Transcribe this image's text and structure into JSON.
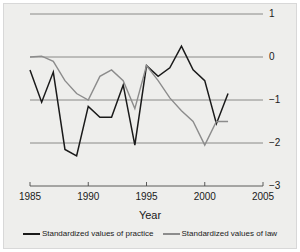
{
  "chart_data": {
    "type": "line",
    "title": "",
    "subtitle": "",
    "xlabel": "Year",
    "ylabel": "",
    "xlim": [
      1985,
      2005
    ],
    "ylim": [
      -3,
      1
    ],
    "grid": true,
    "grid_axis": "y",
    "legend_position": "bottom",
    "x_ticks": [
      1985,
      1990,
      1995,
      2000,
      2005
    ],
    "x_tick_labels": [
      "1985",
      "1990",
      "1995",
      "2000",
      "2005"
    ],
    "y_ticks": [
      1,
      0,
      -1,
      -2,
      -3
    ],
    "y_tick_labels": [
      "1",
      "0",
      "−1",
      "−2",
      "−3"
    ],
    "y_axis_side": "right",
    "series": [
      {
        "name": "Standardized values of practice",
        "color": "#1a1a1a",
        "x": [
          1985,
          1986,
          1987,
          1988,
          1989,
          1990,
          1991,
          1992,
          1993,
          1994,
          1995,
          1996,
          1997,
          1998,
          1999,
          2000,
          2001,
          2002
        ],
        "values": [
          -0.3,
          -1.05,
          -0.35,
          -2.15,
          -2.3,
          -1.15,
          -1.4,
          -1.4,
          -0.65,
          -2.05,
          -0.2,
          -0.45,
          -0.25,
          0.25,
          -0.3,
          -0.55,
          -1.55,
          -0.85
        ]
      },
      {
        "name": "Standardized values of law",
        "color": "#8c8c8c",
        "x": [
          1985,
          1986,
          1987,
          1988,
          1989,
          1990,
          1991,
          1992,
          1993,
          1994,
          1995,
          1996,
          1997,
          1998,
          1999,
          2000,
          2001,
          2002
        ],
        "values": [
          0.0,
          0.02,
          -0.1,
          -0.55,
          -0.85,
          -1.0,
          -0.45,
          -0.3,
          -0.55,
          -1.2,
          -0.2,
          -0.55,
          -0.95,
          -1.25,
          -1.5,
          -2.05,
          -1.5,
          -1.5
        ]
      }
    ]
  },
  "axis": {
    "x_title": "Year"
  },
  "legend": {
    "entries": [
      {
        "label": "Standardized values of practice",
        "color": "#1a1a1a"
      },
      {
        "label": "Standardized values of law",
        "color": "#8c8c8c"
      }
    ]
  },
  "colors": {
    "background": "#eeeeec",
    "page": "#ffffff",
    "gridline": "#6e6e6e",
    "axis": "#4a4a4a",
    "practice": "#1a1a1a",
    "law": "#8c8c8c",
    "text": "#1a1a1a"
  }
}
